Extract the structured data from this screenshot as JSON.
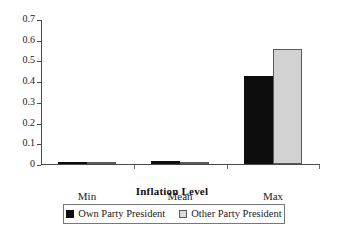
{
  "chart_data": {
    "type": "bar",
    "title": "",
    "subtitle": "",
    "xlabel": "Inflation Level",
    "ylabel": "",
    "categories": [
      "Min",
      "Mean",
      "Max"
    ],
    "series": [
      {
        "name": "Own Party President",
        "values": [
          0,
          0.013,
          0.43
        ],
        "color": "#0d0d0d"
      },
      {
        "name": "Other Party President",
        "values": [
          0,
          0.002,
          0.56
        ],
        "color": "#d2d2d2"
      }
    ],
    "ylim": [
      0,
      0.7
    ],
    "ytick_labels": [
      "0.7",
      "0.6",
      "0.5",
      "0.4",
      "0.3",
      "0.2",
      "0.1",
      "0"
    ],
    "ytick_values": [
      0.7,
      0.6,
      0.5,
      0.4,
      0.3,
      0.2,
      0.1,
      0
    ],
    "grid": false,
    "legend_position": "bottom"
  },
  "axes": {
    "y": {
      "ticks": [
        {
          "label": "0.7",
          "value": 0.7
        },
        {
          "label": "0.6",
          "value": 0.6
        },
        {
          "label": "0.5",
          "value": 0.5
        },
        {
          "label": "0.4",
          "value": 0.4
        },
        {
          "label": "0.3",
          "value": 0.3
        },
        {
          "label": "0.2",
          "value": 0.2
        },
        {
          "label": "0.1",
          "value": 0.1
        },
        {
          "label": "0",
          "value": 0
        }
      ]
    },
    "x": {
      "title": "Inflation Level",
      "categories": [
        {
          "label": "Min"
        },
        {
          "label": "Mean"
        },
        {
          "label": "Max"
        }
      ]
    }
  },
  "legend": {
    "entries": [
      {
        "label": "Own Party President",
        "swatch": "filled-black-square"
      },
      {
        "label": "Other Party President",
        "swatch": "outlined-light-square"
      }
    ]
  }
}
